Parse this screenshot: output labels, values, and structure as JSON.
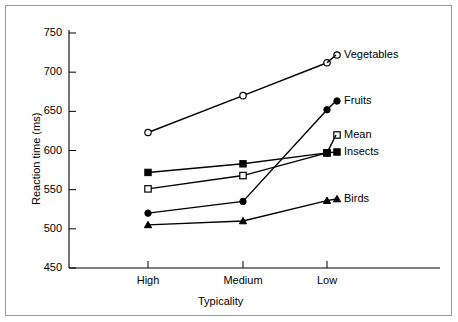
{
  "chart_data": {
    "type": "line",
    "title": "",
    "xlabel": "Typicality",
    "ylabel": "Reaction time (ms)",
    "categories": [
      "High",
      "Medium",
      "Low"
    ],
    "ylim": [
      450,
      750
    ],
    "yticks": [
      450,
      500,
      550,
      600,
      650,
      700,
      750
    ],
    "grid": false,
    "legend_position": "inline-right",
    "series": [
      {
        "name": "Vegetables",
        "marker": "open-circle",
        "values": [
          623,
          670,
          712
        ]
      },
      {
        "name": "Fruits",
        "marker": "filled-circle",
        "values": [
          520,
          535,
          652
        ]
      },
      {
        "name": "Mean",
        "marker": "open-square",
        "values": [
          551,
          568,
          597
        ]
      },
      {
        "name": "Insects",
        "marker": "filled-square",
        "values": [
          572,
          583,
          597
        ]
      },
      {
        "name": "Birds",
        "marker": "filled-triangle",
        "values": [
          505,
          510,
          536
        ]
      }
    ]
  },
  "axes": {
    "y_tick_labels": [
      "750",
      "700",
      "650",
      "600",
      "550",
      "500",
      "450"
    ],
    "x_tick_labels": [
      "High",
      "Medium",
      "Low"
    ],
    "y_axis_title": "Reaction time (ms)",
    "x_axis_title": "Typicality"
  },
  "series_labels": {
    "vegetables": "Vegetables",
    "fruits": "Fruits",
    "mean": "Mean",
    "insects": "Insects",
    "birds": "Birds"
  },
  "colors": {
    "line": "#000000",
    "axis": "#000000",
    "frame": "#9a9a9a",
    "background": "#ffffff"
  }
}
